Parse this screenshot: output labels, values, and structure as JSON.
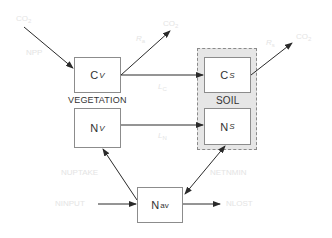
{
  "diagram": {
    "title": "",
    "groups": {
      "vegetation": "VEGETATION",
      "soil": "SOIL"
    },
    "nodes": {
      "cv": {
        "main": "C",
        "sub": "V"
      },
      "nv": {
        "main": "N",
        "sub": "V"
      },
      "cs": {
        "main": "C",
        "sub": "S"
      },
      "ns": {
        "main": "N",
        "sub": "S"
      },
      "nav": {
        "main": "N",
        "sub": "av"
      }
    },
    "flow_labels": {
      "co2_in": "CO",
      "co2_in_sub": "2",
      "npp": "NPP",
      "ra": "R",
      "ra_sub": "a",
      "co2_out_veg": "CO",
      "co2_out_veg_sub": "2",
      "rs": "R",
      "rs_sub": "s",
      "co2_out_soil": "CO",
      "co2_out_soil_sub": "2",
      "lc": "L",
      "lc_sub": "C",
      "ln": "L",
      "ln_sub": "N",
      "nuptake": "NUPTAKE",
      "ninput": "NINPUT",
      "netnmin": "NETNMIN",
      "nlost": "NLOST"
    },
    "edges": [
      {
        "from": "atmosphere",
        "to": "cv",
        "label": "NPP"
      },
      {
        "from": "cv",
        "to": "atmosphere",
        "label": "Ra"
      },
      {
        "from": "cv",
        "to": "cs",
        "label": "Lc"
      },
      {
        "from": "nv",
        "to": "ns",
        "label": "Ln"
      },
      {
        "from": "cs",
        "to": "atmosphere",
        "label": "Rs"
      },
      {
        "from": "nav",
        "to": "nv",
        "label": "NUPTAKE"
      },
      {
        "from": "ninput",
        "to": "nav",
        "label": "NINPUT"
      },
      {
        "from": "nav",
        "to": "ns",
        "label": "NETNMIN",
        "bidirectional": true
      },
      {
        "from": "nav",
        "to": "out",
        "label": "NLOST"
      }
    ],
    "colors": {
      "line": "#2a2a2a",
      "box_border": "#8c8c8c",
      "soil_fill": "#e6e6e6",
      "faint_text": "#e4e4e4"
    }
  }
}
